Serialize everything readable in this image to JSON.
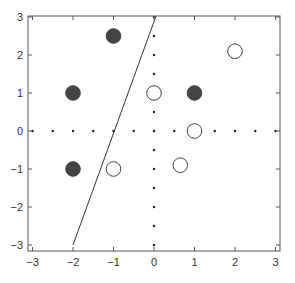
{
  "chart_data": {
    "type": "scatter",
    "title": "",
    "xlabel": "",
    "ylabel": "",
    "xlim": [
      -3.1,
      3.1
    ],
    "ylim": [
      -3.1,
      3.1
    ],
    "x_ticks": [
      -3,
      -2,
      -1,
      0,
      1,
      2,
      3
    ],
    "y_ticks": [
      -3,
      -2,
      -1,
      0,
      1,
      2,
      3
    ],
    "x_tick_labels": [
      "−3",
      "−2",
      "−1",
      "0",
      "1",
      "2",
      "3"
    ],
    "y_tick_labels": [
      "−3",
      "−2",
      "−1",
      "0",
      "1",
      "2",
      "3"
    ],
    "grid": false,
    "legend": null,
    "series": [
      {
        "name": "filled",
        "marker": "filled-circle",
        "color": "#444444",
        "points": [
          [
            -1,
            2.5
          ],
          [
            -2,
            1
          ],
          [
            1,
            1
          ],
          [
            -2,
            -1
          ]
        ]
      },
      {
        "name": "open",
        "marker": "open-circle",
        "color": "#444444",
        "points": [
          [
            2,
            2.1
          ],
          [
            0,
            1
          ],
          [
            1,
            0
          ],
          [
            0.65,
            -0.9
          ],
          [
            -1,
            -1
          ]
        ]
      }
    ],
    "lines": [
      {
        "name": "separator",
        "from": [
          -2,
          -3
        ],
        "to": [
          0.05,
          3.15
        ],
        "color": "#333333"
      }
    ],
    "dotted_axes": {
      "spacing": 0.5,
      "x_axis_y": 0,
      "y_axis_x": 0,
      "color": "#222222"
    }
  }
}
